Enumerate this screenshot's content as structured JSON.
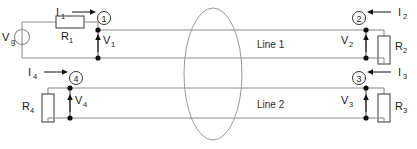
{
  "diagram": {
    "source": {
      "label": "V",
      "sub": "g",
      "name": "voltage-source"
    },
    "lines": [
      {
        "label": "Line 1"
      },
      {
        "label": "Line 2"
      }
    ],
    "nodes": [
      {
        "id": "1",
        "label": "1"
      },
      {
        "id": "2",
        "label": "2"
      },
      {
        "id": "3",
        "label": "3"
      },
      {
        "id": "4",
        "label": "4"
      }
    ],
    "resistors": [
      {
        "id": "R1",
        "label": "R",
        "sub": "1"
      },
      {
        "id": "R2",
        "label": "R",
        "sub": "2"
      },
      {
        "id": "R3",
        "label": "R",
        "sub": "3"
      },
      {
        "id": "R4",
        "label": "R",
        "sub": "4"
      }
    ],
    "currents": [
      {
        "id": "I1",
        "label": "I",
        "sub": "1"
      },
      {
        "id": "I2",
        "label": "I",
        "sub": "2"
      },
      {
        "id": "I3",
        "label": "I",
        "sub": "3"
      },
      {
        "id": "I4",
        "label": "I",
        "sub": "4"
      }
    ],
    "voltages": [
      {
        "id": "V1",
        "label": "V",
        "sub": "1"
      },
      {
        "id": "V2",
        "label": "V",
        "sub": "2"
      },
      {
        "id": "V3",
        "label": "V",
        "sub": "3"
      },
      {
        "id": "V4",
        "label": "V",
        "sub": "4"
      }
    ],
    "coupling_region": {
      "name": "coupling-ellipse"
    },
    "colors": {
      "wire": "#8e8e8e",
      "component": "#4a4a4a",
      "text": "#1a1a1a",
      "background": "#ffffff"
    }
  }
}
